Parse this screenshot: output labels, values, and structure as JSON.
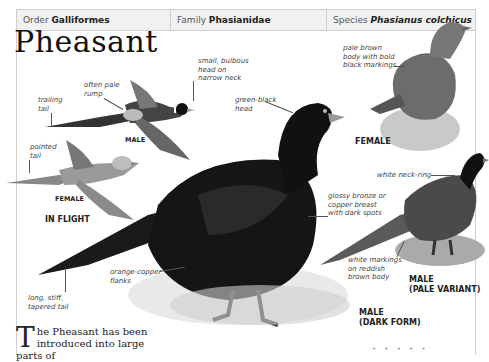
{
  "header": {
    "order_label": "Order",
    "order_value": "Galliformes",
    "family_label": "Family",
    "family_value": "Phasianidae",
    "species_label": "Species",
    "species_value": "Phasianus colchicus"
  },
  "title": "Pheasant",
  "annotations": {
    "trailing_tail": "trailing\ntail",
    "pale_rump": "often pale\nrump",
    "bulbous_head": "small, bulbous\nhead on\nnarrow neck",
    "pointed_tail": "pointed\ntail",
    "green_head": "green-black\nhead",
    "female_body": "pale brown\nbody with bold\nblack markings",
    "neck_ring": "white neck-ring",
    "bronze_breast": "glossy bronze or\ncopper breast\nwith dark spots",
    "orange_flanks": "orange-copper\nflanks",
    "long_tail": "long, stiff,\ntapered tail",
    "white_markings": "white markings\non reddish\nbrown body"
  },
  "captions": {
    "flight_male": "MALE",
    "flight_female": "FEMALE",
    "in_flight": "IN FLIGHT",
    "female": "FEMALE",
    "male_pale_line1": "MALE",
    "male_pale_line2": "(PALE VARIANT)",
    "male_dark_line1": "MALE",
    "male_dark_line2": "(DARK FORM)"
  },
  "body_text": {
    "dropcap": "T",
    "text": "he Pheasant has been introduced into large parts of"
  },
  "footer_dots": "• • • • •"
}
